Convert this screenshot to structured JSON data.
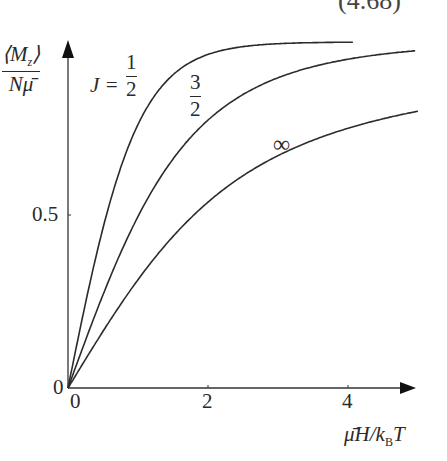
{
  "equation_number": "(4.68)",
  "chart_data": {
    "type": "line",
    "title": "",
    "xlabel": "μ̄H/k_B T",
    "ylabel": "⟨M_z⟩ / Nμ̄",
    "xlim": [
      0,
      5
    ],
    "ylim": [
      0,
      1
    ],
    "x_ticks": [
      "0",
      "2",
      "4"
    ],
    "y_ticks": [
      "0",
      "0.5"
    ],
    "grid": false,
    "legend": "inline curve labels",
    "series": [
      {
        "name": "J = 1/2",
        "function": "B_1/2(x) = tanh(x)",
        "x": [
          0,
          0.5,
          1,
          1.5,
          2,
          3,
          4.07
        ],
        "values": [
          0,
          0.46,
          0.76,
          0.91,
          0.96,
          0.995,
          0.999
        ]
      },
      {
        "name": "J = 3/2",
        "function": "B_3/2(x)",
        "x": [
          0,
          0.5,
          1,
          1.5,
          2,
          3,
          4,
          5
        ],
        "values": [
          0,
          0.27,
          0.5,
          0.67,
          0.78,
          0.89,
          0.93,
          0.95
        ]
      },
      {
        "name": "J = ∞",
        "function": "L(x) = coth(x) − 1/x",
        "x": [
          0,
          0.5,
          1,
          1.5,
          2,
          3,
          4,
          5
        ],
        "values": [
          0,
          0.16,
          0.31,
          0.43,
          0.54,
          0.67,
          0.75,
          0.8
        ]
      }
    ]
  },
  "labels": {
    "ylabel_num": "⟨M",
    "ylabel_sub": "z",
    "ylabel_close": "⟩",
    "ylabel_den": "Nμ̄",
    "x_axis_label_main": "μ̄H/k",
    "x_axis_label_sub": "B",
    "x_axis_label_end": "T",
    "origin_y": "0",
    "origin_x": "0",
    "tick_x_2": "2",
    "tick_x_4": "4",
    "tick_y_05": "0.5",
    "curve1_prefix": "J =",
    "curve1_num": "1",
    "curve1_den": "2",
    "curve2_num": "3",
    "curve2_den": "2",
    "curve3": "∞"
  }
}
